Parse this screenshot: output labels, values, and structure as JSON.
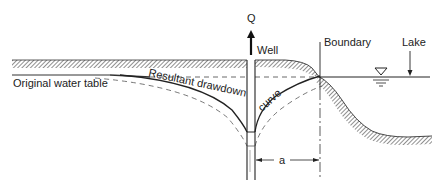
{
  "figure": {
    "labels": {
      "discharge": "Q",
      "well": "Well",
      "boundary": "Boundary",
      "lake": "Lake",
      "original_water_table": "Original water table",
      "resultant_drawdown_part1": "Resultant drawdown",
      "resultant_drawdown_part2": "curve",
      "distance": "a"
    },
    "colors": {
      "ink": "#222222",
      "hatch": "#333333",
      "background": "#ffffff"
    },
    "symbols": {
      "water_surface": "inverted-triangle"
    }
  }
}
